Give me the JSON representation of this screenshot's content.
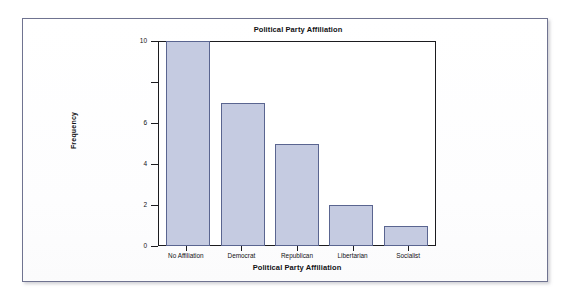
{
  "card": {
    "name": "chart-card"
  },
  "chart_data": {
    "type": "bar",
    "title": "Political Party Affiliation",
    "xlabel": "Political Party Affiliation",
    "ylabel": "Frequency",
    "categories": [
      "No Affiliation",
      "Democrat",
      "Republican",
      "Libertarian",
      "Socialist"
    ],
    "values": [
      10,
      7,
      5,
      2,
      1
    ],
    "ylim": [
      0,
      10
    ],
    "yticks": [
      0,
      2,
      4,
      6,
      8,
      10
    ],
    "ytick_labels": [
      "0",
      "2",
      "4",
      "6",
      "",
      "10"
    ],
    "grid": false,
    "legend": null,
    "bar_fill_color": "#c5cbe1",
    "bar_edge_color": "#5a6590",
    "axis_color": "#1b1b1f"
  }
}
